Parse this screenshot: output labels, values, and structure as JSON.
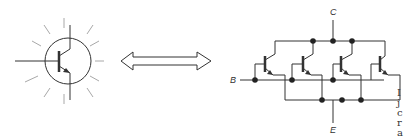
{
  "diagram": {
    "left_symbol": {
      "name": "Bipolar transistor symbol with glow rays",
      "ray_count": 12
    },
    "equivalence_arrow": {
      "type": "double-headed hollow arrow"
    },
    "right_circuit": {
      "name": "Parallel-connected transistors",
      "transistor_count": 4,
      "labels": {
        "collector": "C",
        "base": "B",
        "emitter": "E"
      }
    },
    "side_text_fragments": [
      "I",
      "j",
      "c",
      "r",
      "a"
    ],
    "colors": {
      "line": "#333333",
      "rays": "#9a9a9a",
      "background": "#ffffff"
    }
  }
}
